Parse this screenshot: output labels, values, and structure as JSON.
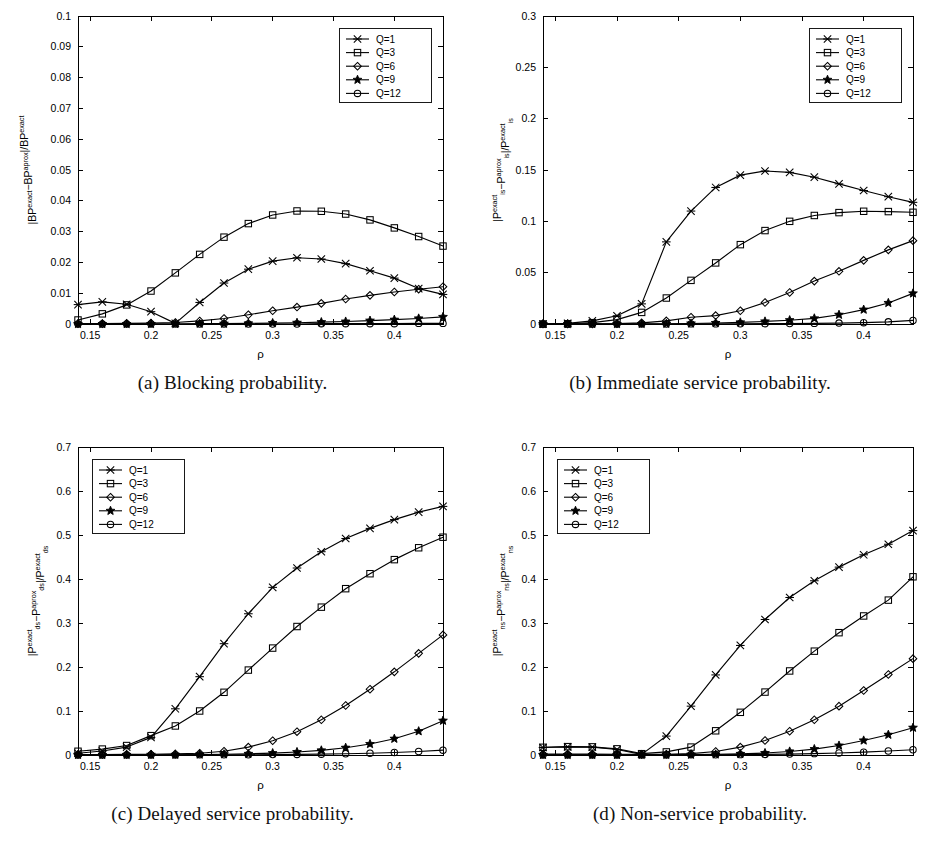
{
  "figure": {
    "name": "four-panel-relative-error-figure",
    "background": "#ffffff",
    "line_color": "#000000"
  },
  "legend": {
    "entries": [
      {
        "label": "Q=1",
        "marker": "asterisk-marker"
      },
      {
        "label": "Q=3",
        "marker": "square-marker"
      },
      {
        "label": "Q=6",
        "marker": "diamond-marker"
      },
      {
        "label": "Q=9",
        "marker": "star-marker"
      },
      {
        "label": "Q=12",
        "marker": "circle-marker"
      }
    ]
  },
  "panels": [
    {
      "id": "a",
      "caption": "(a) Blocking probability."
    },
    {
      "id": "b",
      "caption": "(b) Immediate service probability."
    },
    {
      "id": "c",
      "caption": "(c) Delayed service probability."
    },
    {
      "id": "d",
      "caption": "(d) Non-service probability."
    }
  ],
  "chart_data": [
    {
      "panel": "a",
      "type": "line",
      "title": "",
      "caption": "(a) Blocking probability.",
      "xlabel": "ρ",
      "ylabel": "|BP^exact − BP^aprox| / BP^exact",
      "ylabel_parts": {
        "prefix": "|BP",
        "sup1": "exact",
        "mid": "−BP",
        "sup2": "aprox",
        "suffix": "|/BP",
        "sup3": "exact",
        "sub": ""
      },
      "xlim": [
        0.14,
        0.44
      ],
      "ylim": [
        0,
        0.1
      ],
      "xticks": [
        0.15,
        0.2,
        0.25,
        0.3,
        0.35,
        0.4
      ],
      "xticklabels": [
        "0.15",
        "0.2",
        "0.25",
        "0.3",
        "0.35",
        "0.4"
      ],
      "yticks": [
        0,
        0.01,
        0.02,
        0.03,
        0.04,
        0.05,
        0.06,
        0.07,
        0.08,
        0.09,
        0.1
      ],
      "yticklabels": [
        "0",
        "0.01",
        "0.02",
        "0.03",
        "0.04",
        "0.05",
        "0.06",
        "0.07",
        "0.08",
        "0.09",
        "0.1"
      ],
      "grid": false,
      "legend_position": "top-right",
      "x": [
        0.14,
        0.16,
        0.18,
        0.2,
        0.22,
        0.24,
        0.26,
        0.28,
        0.3,
        0.32,
        0.34,
        0.36,
        0.38,
        0.4,
        0.42,
        0.44
      ],
      "series": [
        {
          "name": "Q=1",
          "marker": "asterisk-marker",
          "values": [
            0.0063,
            0.0072,
            0.0064,
            0.004,
            0.0002,
            0.007,
            0.0133,
            0.0178,
            0.0204,
            0.0215,
            0.0211,
            0.0196,
            0.0173,
            0.0149,
            0.0115,
            0.0096
          ]
        },
        {
          "name": "Q=3",
          "marker": "square-marker",
          "values": [
            0.0013,
            0.0033,
            0.0062,
            0.0107,
            0.0166,
            0.0226,
            0.0282,
            0.0326,
            0.0354,
            0.0367,
            0.0366,
            0.0357,
            0.0338,
            0.0312,
            0.0284,
            0.0253
          ]
        },
        {
          "name": "Q=6",
          "marker": "diamond-marker",
          "values": [
            0.0001,
            0.0001,
            0.0002,
            0.0003,
            0.0005,
            0.001,
            0.0018,
            0.003,
            0.0043,
            0.0055,
            0.0067,
            0.0081,
            0.0093,
            0.0104,
            0.0113,
            0.0121
          ]
        },
        {
          "name": "Q=9",
          "marker": "star-marker",
          "values": [
            0.0,
            0.0,
            0.0,
            0.0,
            0.0,
            0.0001,
            0.0001,
            0.0002,
            0.0003,
            0.0004,
            0.0006,
            0.0008,
            0.0011,
            0.0014,
            0.0018,
            0.0023
          ]
        },
        {
          "name": "Q=12",
          "marker": "circle-marker",
          "values": [
            0.0,
            0.0,
            0.0,
            0.0,
            0.0,
            0.0,
            0.0,
            0.0,
            0.0,
            0.0,
            0.0001,
            0.0001,
            0.0001,
            0.0001,
            0.0002,
            0.0002
          ]
        }
      ]
    },
    {
      "panel": "b",
      "type": "line",
      "title": "",
      "caption": "(b) Immediate service probability.",
      "xlabel": "ρ",
      "ylabel": "|P_is^exact − P_is^aprox| / P_is^exact",
      "ylabel_parts": {
        "prefix": "|P",
        "sup1": "exact",
        "sub1": "is",
        "mid": "−P",
        "sup2": "aprox",
        "sub2": "is",
        "suffix": "|/P",
        "sup3": "exact",
        "sub3": "is"
      },
      "xlim": [
        0.14,
        0.44
      ],
      "ylim": [
        0,
        0.3
      ],
      "xticks": [
        0.15,
        0.2,
        0.25,
        0.3,
        0.35,
        0.4
      ],
      "xticklabels": [
        "0.15",
        "0.2",
        "0.25",
        "0.3",
        "0.35",
        "0.4"
      ],
      "yticks": [
        0,
        0.05,
        0.1,
        0.15,
        0.2,
        0.25,
        0.3
      ],
      "yticklabels": [
        "0",
        "0.05",
        "0.1",
        "0.15",
        "0.2",
        "0.25",
        "0.3"
      ],
      "grid": false,
      "legend_position": "top-right",
      "x": [
        0.14,
        0.16,
        0.18,
        0.2,
        0.22,
        0.24,
        0.26,
        0.28,
        0.3,
        0.32,
        0.34,
        0.36,
        0.38,
        0.4,
        0.42,
        0.44
      ],
      "series": [
        {
          "name": "Q=1",
          "marker": "asterisk-marker",
          "values": [
            0.0,
            0.0006,
            0.003,
            0.008,
            0.0196,
            0.08,
            0.11,
            0.133,
            0.145,
            0.149,
            0.1477,
            0.143,
            0.1365,
            0.13,
            0.124,
            0.1185
          ]
        },
        {
          "name": "Q=3",
          "marker": "square-marker",
          "values": [
            0.0,
            0.0002,
            0.0013,
            0.0043,
            0.0113,
            0.0253,
            0.0425,
            0.0595,
            0.0773,
            0.091,
            0.1,
            0.1057,
            0.1085,
            0.1098,
            0.1095,
            0.1088
          ]
        },
        {
          "name": "Q=6",
          "marker": "diamond-marker",
          "values": [
            0.0,
            0.0,
            0.0001,
            0.0003,
            0.0011,
            0.0031,
            0.0066,
            0.0082,
            0.0129,
            0.0209,
            0.0307,
            0.0418,
            0.0513,
            0.062,
            0.0722,
            0.0812
          ]
        },
        {
          "name": "Q=9",
          "marker": "star-marker",
          "values": [
            0.0,
            0.0,
            0.0,
            0.0,
            0.0001,
            0.0002,
            0.0005,
            0.001,
            0.0016,
            0.0025,
            0.0037,
            0.0055,
            0.009,
            0.014,
            0.0205,
            0.0298
          ]
        },
        {
          "name": "Q=12",
          "marker": "circle-marker",
          "values": [
            0.0,
            0.0,
            0.0,
            0.0,
            0.0,
            0.0,
            0.0001,
            0.0001,
            0.0002,
            0.0003,
            0.0004,
            0.0006,
            0.0009,
            0.0013,
            0.0021,
            0.0035
          ]
        }
      ]
    },
    {
      "panel": "c",
      "type": "line",
      "title": "",
      "caption": "(c) Delayed service probability.",
      "xlabel": "ρ",
      "ylabel": "|P_ds^exact − P_ds^aprox| / P_ds^exact",
      "ylabel_parts": {
        "prefix": "|P",
        "sup1": "exact",
        "sub1": "ds",
        "mid": "−P",
        "sup2": "aprox",
        "sub2": "ds",
        "suffix": "|/P",
        "sup3": "exact",
        "sub3": "ds"
      },
      "xlim": [
        0.14,
        0.44
      ],
      "ylim": [
        0,
        0.7
      ],
      "xticks": [
        0.15,
        0.2,
        0.25,
        0.3,
        0.35,
        0.4
      ],
      "xticklabels": [
        "0.15",
        "0.2",
        "0.25",
        "0.3",
        "0.35",
        "0.4"
      ],
      "yticks": [
        0,
        0.1,
        0.2,
        0.3,
        0.4,
        0.5,
        0.6,
        0.7
      ],
      "yticklabels": [
        "0",
        "0.1",
        "0.2",
        "0.3",
        "0.4",
        "0.5",
        "0.6",
        "0.7"
      ],
      "grid": false,
      "legend_position": "top-left",
      "x": [
        0.14,
        0.16,
        0.18,
        0.2,
        0.22,
        0.24,
        0.26,
        0.28,
        0.3,
        0.32,
        0.34,
        0.36,
        0.38,
        0.4,
        0.42,
        0.44
      ],
      "series": [
        {
          "name": "Q=1",
          "marker": "asterisk-marker",
          "values": [
            0.004,
            0.009,
            0.018,
            0.04,
            0.105,
            0.178,
            0.253,
            0.321,
            0.381,
            0.425,
            0.462,
            0.492,
            0.515,
            0.535,
            0.552,
            0.565
          ]
        },
        {
          "name": "Q=3",
          "marker": "square-marker",
          "values": [
            0.0085,
            0.0135,
            0.0215,
            0.044,
            0.066,
            0.1,
            0.1425,
            0.193,
            0.243,
            0.292,
            0.336,
            0.378,
            0.412,
            0.444,
            0.471,
            0.495
          ]
        },
        {
          "name": "Q=6",
          "marker": "diamond-marker",
          "values": [
            0.001,
            0.0012,
            0.0015,
            0.0018,
            0.0025,
            0.004,
            0.0085,
            0.018,
            0.0325,
            0.053,
            0.08,
            0.1125,
            0.1495,
            0.189,
            0.231,
            0.273
          ]
        },
        {
          "name": "Q=9",
          "marker": "star-marker",
          "values": [
            0.0002,
            0.0002,
            0.0003,
            0.0004,
            0.0006,
            0.001,
            0.0016,
            0.0026,
            0.0042,
            0.0068,
            0.0105,
            0.0165,
            0.025,
            0.037,
            0.054,
            0.078
          ]
        },
        {
          "name": "Q=12",
          "marker": "circle-marker",
          "values": [
            0.0,
            0.0,
            0.0001,
            0.0001,
            0.0002,
            0.0003,
            0.0004,
            0.0006,
            0.0009,
            0.0013,
            0.0019,
            0.0028,
            0.004,
            0.0057,
            0.008,
            0.011
          ]
        }
      ]
    },
    {
      "panel": "d",
      "type": "line",
      "title": "",
      "caption": "(d) Non-service probability.",
      "xlabel": "ρ",
      "ylabel": "|P_ns^exact − P_ns^aprox| / P_ns^exact",
      "ylabel_parts": {
        "prefix": "|P",
        "sup1": "exact",
        "sub1": "ns",
        "mid": "−P",
        "sup2": "aprox",
        "sub2": "ns",
        "suffix": "|/P",
        "sup3": "exact",
        "sub3": "ns"
      },
      "xlim": [
        0.14,
        0.44
      ],
      "ylim": [
        0,
        0.7
      ],
      "xticks": [
        0.15,
        0.2,
        0.25,
        0.3,
        0.35,
        0.4
      ],
      "xticklabels": [
        "0.15",
        "0.2",
        "0.25",
        "0.3",
        "0.35",
        "0.4"
      ],
      "yticks": [
        0,
        0.1,
        0.2,
        0.3,
        0.4,
        0.5,
        0.6,
        0.7
      ],
      "yticklabels": [
        "0",
        "0.1",
        "0.2",
        "0.3",
        "0.4",
        "0.5",
        "0.6",
        "0.7"
      ],
      "grid": false,
      "legend_position": "top-left",
      "x": [
        0.14,
        0.16,
        0.18,
        0.2,
        0.22,
        0.24,
        0.26,
        0.28,
        0.3,
        0.32,
        0.34,
        0.36,
        0.38,
        0.4,
        0.42,
        0.44
      ],
      "series": [
        {
          "name": "Q=1",
          "marker": "asterisk-marker",
          "values": [
            0.017,
            0.0185,
            0.018,
            0.0125,
            0.0015,
            0.043,
            0.111,
            0.182,
            0.249,
            0.308,
            0.358,
            0.396,
            0.427,
            0.455,
            0.479,
            0.51
          ]
        },
        {
          "name": "Q=3",
          "marker": "square-marker",
          "values": [
            0.0175,
            0.019,
            0.0185,
            0.014,
            0.003,
            0.007,
            0.018,
            0.055,
            0.097,
            0.143,
            0.191,
            0.236,
            0.278,
            0.316,
            0.352,
            0.405
          ]
        },
        {
          "name": "Q=6",
          "marker": "diamond-marker",
          "values": [
            0.002,
            0.002,
            0.002,
            0.0018,
            0.0015,
            0.0018,
            0.003,
            0.008,
            0.018,
            0.033,
            0.054,
            0.08,
            0.111,
            0.1465,
            0.183,
            0.219
          ]
        },
        {
          "name": "Q=9",
          "marker": "star-marker",
          "values": [
            0.0002,
            0.0002,
            0.0002,
            0.0002,
            0.0003,
            0.0004,
            0.0007,
            0.0013,
            0.0025,
            0.0045,
            0.008,
            0.0135,
            0.0215,
            0.033,
            0.046,
            0.062
          ]
        },
        {
          "name": "Q=12",
          "marker": "circle-marker",
          "values": [
            0.0,
            0.0,
            0.0,
            0.0001,
            0.0001,
            0.0002,
            0.0003,
            0.0005,
            0.0008,
            0.0013,
            0.002,
            0.0031,
            0.0046,
            0.0065,
            0.009,
            0.012
          ]
        }
      ]
    }
  ]
}
